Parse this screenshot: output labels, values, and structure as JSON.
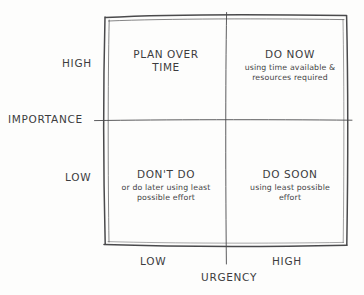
{
  "diagram": {
    "type": "eisenhower-matrix",
    "ink_color": "#3c3c3e",
    "paper_color": "#fdfdfc",
    "axes": {
      "y": {
        "name": "IMPORTANCE",
        "high_label": "HIGH",
        "low_label": "LOW"
      },
      "x": {
        "name": "URGENCY",
        "low_label": "LOW",
        "high_label": "HIGH"
      }
    },
    "quadrants": [
      {
        "id": "plan-over-time",
        "position": "top-left",
        "importance": "HIGH",
        "urgency": "LOW",
        "title": "PLAN OVER\nTIME",
        "subtitle": ""
      },
      {
        "id": "do-now",
        "position": "top-right",
        "importance": "HIGH",
        "urgency": "HIGH",
        "title": "DO NOW",
        "subtitle": "using time available &\nresources required"
      },
      {
        "id": "dont-do",
        "position": "bottom-left",
        "importance": "LOW",
        "urgency": "LOW",
        "title": "DON'T DO",
        "subtitle": "or do later using least\npossible effort"
      },
      {
        "id": "do-soon",
        "position": "bottom-right",
        "importance": "LOW",
        "urgency": "HIGH",
        "title": "DO SOON",
        "subtitle": "using least possible\neffort"
      }
    ]
  }
}
